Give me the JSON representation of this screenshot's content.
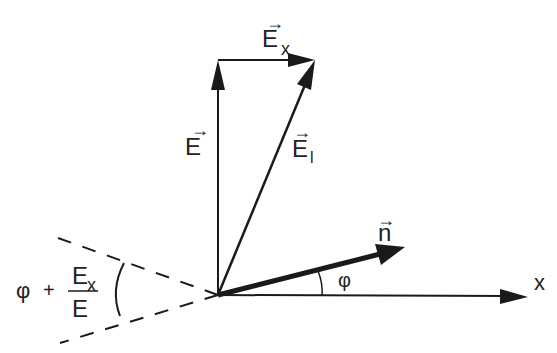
{
  "diagram": {
    "title": "",
    "colors": {
      "stroke": "#1a1a1a",
      "background": "#ffffff"
    },
    "labels": {
      "E_vertical": {
        "main": "E",
        "arrow": "→"
      },
      "E_x": {
        "main": "E",
        "sub": "x",
        "arrow": "→"
      },
      "E_l": {
        "main": "E",
        "sub": "l",
        "arrow": "→"
      },
      "n": {
        "main": "n",
        "arrow": "→"
      },
      "phi": "φ",
      "x_axis": "x",
      "formula": {
        "phi": "φ",
        "plus": "+",
        "numerator_main": "E",
        "numerator_sub": "x",
        "denominator": "E"
      }
    },
    "vectors": [
      {
        "name": "E",
        "from": [
          218,
          295
        ],
        "to": [
          218,
          60
        ],
        "style": "solid"
      },
      {
        "name": "E_x",
        "from": [
          218,
          60
        ],
        "to": [
          315,
          60
        ],
        "style": "solid"
      },
      {
        "name": "E_l",
        "from": [
          218,
          295
        ],
        "to": [
          315,
          60
        ],
        "style": "solid"
      },
      {
        "name": "n",
        "from": [
          218,
          295
        ],
        "to": [
          405,
          247
        ],
        "style": "thick"
      },
      {
        "name": "x-axis",
        "from": [
          218,
          295
        ],
        "to": [
          528,
          297
        ],
        "style": "solid"
      }
    ],
    "dashed_cone": {
      "apex": [
        218,
        295
      ],
      "upper_end": [
        58,
        238
      ],
      "lower_end": [
        60,
        343
      ]
    }
  }
}
